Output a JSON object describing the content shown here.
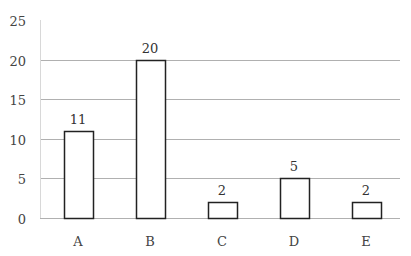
{
  "chart_data": {
    "type": "bar",
    "title": "",
    "xlabel": "",
    "ylabel": "",
    "categories": [
      "A",
      "B",
      "C",
      "D",
      "E"
    ],
    "values": [
      11,
      20,
      2,
      5,
      2
    ],
    "data_labels": [
      "11",
      "20",
      "2",
      "5",
      "2"
    ],
    "ylim": [
      0,
      25
    ],
    "yticks": [
      0,
      5,
      10,
      15,
      20,
      25
    ],
    "ytick_labels": [
      "0",
      "5",
      "10",
      "15",
      "20",
      "25"
    ],
    "grid": true,
    "legend": null,
    "colors": {
      "bar_fill": "#ffffff",
      "bar_stroke": "#222222",
      "grid": "#b0b0b0"
    }
  }
}
